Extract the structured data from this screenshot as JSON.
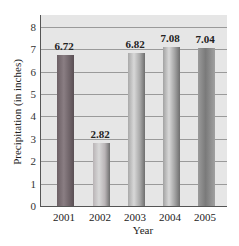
{
  "chart_data": {
    "type": "bar",
    "title": "",
    "xlabel": "Year",
    "ylabel": "Precipitation (in inches)",
    "categories": [
      "2001",
      "2002",
      "2003",
      "2004",
      "2005"
    ],
    "values": [
      6.72,
      2.82,
      6.82,
      7.08,
      7.04
    ],
    "value_labels": [
      "6.72",
      "2.82",
      "6.82",
      "7.08",
      "7.04"
    ],
    "yticks": [
      "0",
      "1",
      "2",
      "3",
      "4",
      "5",
      "6",
      "7",
      "8"
    ],
    "ylim": [
      0,
      8.5
    ],
    "grid": true,
    "legend": null,
    "colors": {
      "plot_background": "#e6e6e6",
      "gridline": "#9a9a9a",
      "bars": [
        "#7a6f73",
        "#b9b4b6",
        "#a9a9a9",
        "#a2a2a2",
        "#8c8c8c"
      ]
    }
  }
}
